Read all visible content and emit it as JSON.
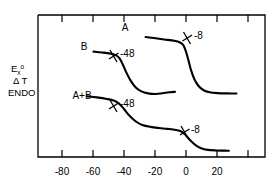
{
  "chart_data": {
    "type": "line",
    "title": "",
    "xlabel": "",
    "ylabel_lines": [
      "Exo",
      "Δ T",
      "ENDO"
    ],
    "xlim": [
      -95,
      40
    ],
    "ylim": [
      0,
      1
    ],
    "grid": false,
    "legend": "none",
    "xticks": [
      -80,
      -60,
      -40,
      -20,
      0,
      20,
      40
    ],
    "xticklabels": [
      "-80",
      "-60",
      "-40",
      "-20",
      "0",
      "20",
      ""
    ],
    "series": [
      {
        "name": "A",
        "label": "A",
        "annotations": [
          {
            "text": "-8",
            "x": -8
          }
        ],
        "points": [
          [
            -31,
            0.845
          ],
          [
            -26,
            0.838
          ],
          [
            -20,
            0.828
          ],
          [
            -14,
            0.818
          ],
          [
            -10.5,
            0.806
          ],
          [
            -8.5,
            0.786
          ],
          [
            -7.0,
            0.742
          ],
          [
            -5.5,
            0.68
          ],
          [
            -4.0,
            0.612
          ],
          [
            -2.0,
            0.548
          ],
          [
            0.5,
            0.5
          ],
          [
            3.5,
            0.47
          ],
          [
            7.0,
            0.456
          ],
          [
            12.0,
            0.45
          ],
          [
            18.0,
            0.448
          ],
          [
            23.0,
            0.447
          ]
        ]
      },
      {
        "name": "B",
        "label": "B",
        "annotations": [
          {
            "text": "-48",
            "x": -48
          }
        ],
        "points": [
          [
            -62,
            0.742
          ],
          [
            -57,
            0.736
          ],
          [
            -52,
            0.728
          ],
          [
            -48.5,
            0.716
          ],
          [
            -46.5,
            0.694
          ],
          [
            -44.5,
            0.65
          ],
          [
            -42.5,
            0.596
          ],
          [
            -40.0,
            0.54
          ],
          [
            -37.0,
            0.492
          ],
          [
            -33.5,
            0.462
          ],
          [
            -29.5,
            0.448
          ],
          [
            -25.0,
            0.444
          ],
          [
            -21.0,
            0.449
          ],
          [
            -17.0,
            0.456
          ],
          [
            -13.5,
            0.459
          ]
        ]
      },
      {
        "name": "A+B",
        "label": "A+B",
        "annotations": [
          {
            "text": "-48",
            "x": -48
          },
          {
            "text": "-8",
            "x": -8
          }
        ],
        "points": [
          [
            -66,
            0.428
          ],
          [
            -60,
            0.42
          ],
          [
            -54,
            0.409
          ],
          [
            -50,
            0.398
          ],
          [
            -47,
            0.378
          ],
          [
            -44,
            0.34
          ],
          [
            -41,
            0.296
          ],
          [
            -37,
            0.252
          ],
          [
            -33,
            0.226
          ],
          [
            -28,
            0.212
          ],
          [
            -23,
            0.204
          ],
          [
            -18,
            0.198
          ],
          [
            -13,
            0.19
          ],
          [
            -9.5,
            0.178
          ],
          [
            -7.0,
            0.152
          ],
          [
            -4.5,
            0.118
          ],
          [
            -1.5,
            0.086
          ],
          [
            2.0,
            0.062
          ],
          [
            6.0,
            0.05
          ],
          [
            11.0,
            0.046
          ],
          [
            16.0,
            0.045
          ],
          [
            18.5,
            0.044
          ]
        ]
      }
    ]
  },
  "axis": {
    "tick_labels": [
      "-80",
      "-60",
      "-40",
      "-20",
      "0",
      "20"
    ]
  },
  "ylabel": {
    "line1_main": "E",
    "line1_sub": "x",
    "line1_sup": "o",
    "line2": "Δ T",
    "line3": "ENDO"
  },
  "labels": {
    "curve_a": "A",
    "curve_b": "B",
    "curve_ab": "A+B",
    "annot_a_minus8": "-8",
    "annot_b_minus48": "-48",
    "annot_ab_minus48": "-48",
    "annot_ab_minus8": "-8"
  }
}
